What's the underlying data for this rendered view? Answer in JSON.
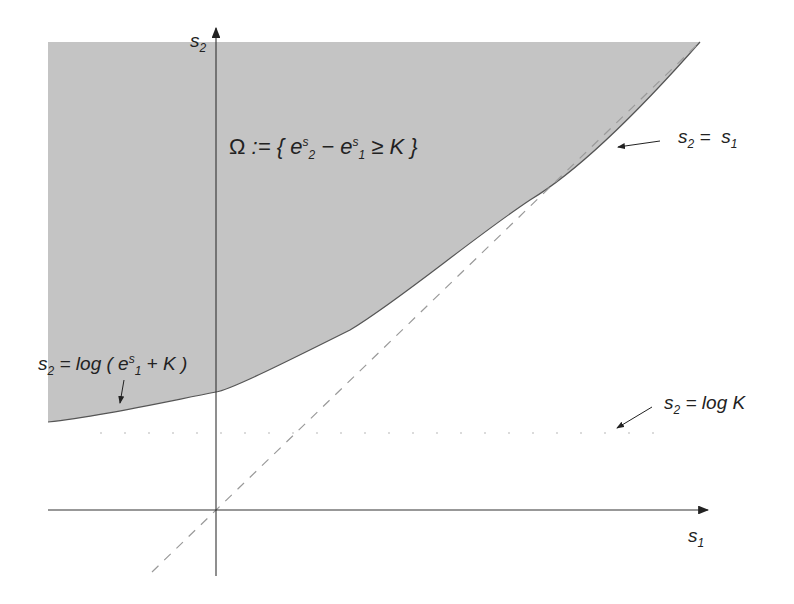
{
  "diagram": {
    "title_set": {
      "omega": "Ω",
      "def": ":= {",
      "e1": "e",
      "s_sup": "s",
      "sub2": "2",
      "minus": "−",
      "e2": "e",
      "s_sup2": "s",
      "sub1": "1",
      "rest": "≥ K }"
    },
    "axes": {
      "x_label": "s",
      "x_sub": "1",
      "y_label": "s",
      "y_sub": "2"
    },
    "annotations": {
      "diagonal": {
        "lhs": "s",
        "lhs_sub": "2",
        "eq": " =  ",
        "rhs": "s",
        "rhs_sub": "1"
      },
      "curve": {
        "lhs": "s",
        "lhs_sub": "2",
        "eq": " = log ( e",
        "sup": "s",
        "sub": "1",
        "rest": " + K )"
      },
      "asymptote": {
        "lhs": "s",
        "lhs_sub": "2",
        "eq": " = log K"
      }
    },
    "colors": {
      "region": "#c4c4c4",
      "axis": "#333333",
      "dashed": "#9a9a9a",
      "curve": "#555555"
    }
  }
}
